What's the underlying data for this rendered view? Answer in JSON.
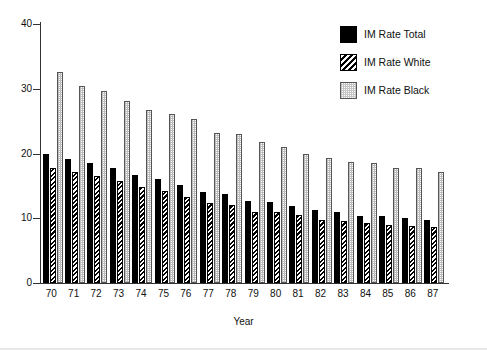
{
  "chart_data": {
    "type": "bar",
    "title": "",
    "xlabel": "Year",
    "ylabel": "",
    "ylim": [
      0,
      40
    ],
    "yticks": [
      0,
      10,
      20,
      30,
      40
    ],
    "grid": false,
    "legend_position": "top-right",
    "categories": [
      "70",
      "71",
      "72",
      "73",
      "74",
      "75",
      "76",
      "77",
      "78",
      "79",
      "80",
      "81",
      "82",
      "83",
      "84",
      "85",
      "86",
      "87"
    ],
    "series": [
      {
        "name": "IM Rate Total",
        "pattern": "solid-black",
        "color": "#000000",
        "values": [
          20.0,
          19.1,
          18.5,
          17.7,
          16.7,
          16.1,
          15.2,
          14.1,
          13.8,
          12.6,
          12.5,
          11.9,
          11.2,
          10.9,
          10.4,
          10.4,
          10.1,
          9.8
        ]
      },
      {
        "name": "IM Rate White",
        "pattern": "diagonal-hatch",
        "color": "#000000",
        "values": [
          17.8,
          17.1,
          16.5,
          15.8,
          14.8,
          14.2,
          13.3,
          12.3,
          12.0,
          11.0,
          10.9,
          10.5,
          9.8,
          9.6,
          9.3,
          9.0,
          8.8,
          8.6
        ]
      },
      {
        "name": "IM Rate Black",
        "pattern": "light-dotted",
        "color": "#d9d9d9",
        "values": [
          32.6,
          30.5,
          29.7,
          28.1,
          26.7,
          26.1,
          25.4,
          23.1,
          23.0,
          21.8,
          21.0,
          20.0,
          19.3,
          18.7,
          18.5,
          17.8,
          17.7,
          17.2
        ]
      }
    ]
  },
  "legend": {
    "items": [
      {
        "label": "IM Rate Total"
      },
      {
        "label": "IM Rate White"
      },
      {
        "label": "IM Rate Black"
      }
    ]
  },
  "axes": {
    "x_title": "Year"
  }
}
